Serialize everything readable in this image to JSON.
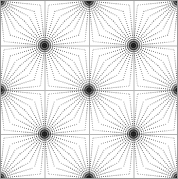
{
  "figure": {
    "title": "Radial burst lattice",
    "alt_text": "Periodic lattice of dotted radial starburst nodes on a white background",
    "width": 178,
    "height": 179,
    "background_color": "#ffffff",
    "frame_color": "#9a9a9a",
    "frame_width": 1
  },
  "chart_data": {
    "type": "scatter",
    "title": "Radial burst lattice",
    "subtitle": "",
    "xlabel": "",
    "ylabel": "",
    "xlim": [
      0,
      178
    ],
    "ylim": [
      0,
      179
    ],
    "grid": false,
    "legend": null,
    "tick_labels": {
      "x": [],
      "y": []
    },
    "annotations": [],
    "pattern": {
      "description": "Checkerboard lattice of radial starbursts; dotted straight rays radiate from each node and meet rays of neighbouring nodes, producing concave cushion-shaped cells.",
      "period_x": 88.5,
      "period_y": 88.5,
      "rays_per_node": 32,
      "ray_color": "#2b2b2b",
      "ray_dot_spacing": 2.1,
      "ray_dot_radius": 0.55,
      "node_core_radius": 3.2,
      "node_core_color": "#111111"
    },
    "nodes": [
      {
        "name": "node-top-left-corner",
        "x": 0,
        "y": 1,
        "kind": "corner"
      },
      {
        "name": "node-top-center",
        "x": 89,
        "y": 1,
        "kind": "edge"
      },
      {
        "name": "node-top-right-corner",
        "x": 178,
        "y": 1,
        "kind": "corner"
      },
      {
        "name": "node-r1-c1",
        "x": 44.5,
        "y": 45.5,
        "kind": "interior"
      },
      {
        "name": "node-r1-c2",
        "x": 133.5,
        "y": 45.5,
        "kind": "interior"
      },
      {
        "name": "node-mid-left",
        "x": 0,
        "y": 90,
        "kind": "edge"
      },
      {
        "name": "node-center",
        "x": 89,
        "y": 90,
        "kind": "interior"
      },
      {
        "name": "node-mid-right",
        "x": 178,
        "y": 90,
        "kind": "edge"
      },
      {
        "name": "node-r2-c1",
        "x": 44.5,
        "y": 134,
        "kind": "interior"
      },
      {
        "name": "node-r2-c2",
        "x": 133.5,
        "y": 134,
        "kind": "interior"
      },
      {
        "name": "node-bottom-left-corner",
        "x": 0,
        "y": 178,
        "kind": "corner"
      },
      {
        "name": "node-bottom-center",
        "x": 89,
        "y": 178,
        "kind": "edge"
      },
      {
        "name": "node-bottom-right-corner",
        "x": 178,
        "y": 178,
        "kind": "corner"
      }
    ],
    "guide_lines": [
      {
        "name": "guide-h-1",
        "orientation": "horizontal",
        "position": 45.5,
        "color": "#b5b5b5"
      },
      {
        "name": "guide-h-2",
        "orientation": "horizontal",
        "position": 90,
        "color": "#b5b5b5"
      },
      {
        "name": "guide-h-3",
        "orientation": "horizontal",
        "position": 134,
        "color": "#b5b5b5"
      },
      {
        "name": "guide-v-1",
        "orientation": "vertical",
        "position": 44.5,
        "color": "#b5b5b5"
      },
      {
        "name": "guide-v-2",
        "orientation": "vertical",
        "position": 89,
        "color": "#b5b5b5"
      },
      {
        "name": "guide-v-3",
        "orientation": "vertical",
        "position": 133.5,
        "color": "#b5b5b5"
      }
    ]
  }
}
